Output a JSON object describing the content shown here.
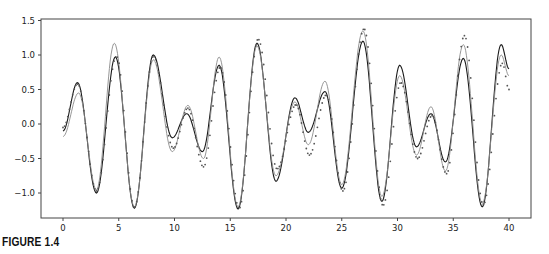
{
  "figure": {
    "caption": "FIGURE 1.4"
  },
  "chart_data": {
    "type": "line",
    "title": "",
    "xlabel": "",
    "ylabel": "",
    "xlim": [
      -2,
      42
    ],
    "ylim": [
      -1.37,
      1.5
    ],
    "xticks": [
      0,
      5,
      10,
      15,
      20,
      25,
      30,
      35,
      40
    ],
    "yticks": [
      1.5,
      1.0,
      0.5,
      0.0,
      -0.5,
      -1.0
    ],
    "ytick_labels": [
      "1.5",
      "1.0",
      "0.5",
      "0.0",
      "−0.5",
      "−1.0"
    ],
    "grid": false,
    "legend": null,
    "series": [
      {
        "name": "signal (black solid)",
        "color": "#1a1a1a",
        "style": "solid",
        "points": [
          [
            0,
            -0.1
          ],
          [
            1.3,
            0.6
          ],
          [
            3.0,
            -1.0
          ],
          [
            4.7,
            0.97
          ],
          [
            6.4,
            -1.22
          ],
          [
            8.1,
            1.0
          ],
          [
            9.8,
            -0.2
          ],
          [
            11.1,
            0.15
          ],
          [
            12.5,
            -0.4
          ],
          [
            14.0,
            0.85
          ],
          [
            15.7,
            -1.23
          ],
          [
            17.4,
            1.17
          ],
          [
            19.1,
            -0.83
          ],
          [
            20.8,
            0.38
          ],
          [
            22.0,
            -0.12
          ],
          [
            23.5,
            0.47
          ],
          [
            25.0,
            -0.93
          ],
          [
            26.9,
            1.2
          ],
          [
            28.6,
            -1.12
          ],
          [
            30.2,
            0.85
          ],
          [
            31.7,
            -0.33
          ],
          [
            33.0,
            0.15
          ],
          [
            34.3,
            -0.55
          ],
          [
            35.9,
            0.95
          ],
          [
            37.6,
            -1.2
          ],
          [
            39.3,
            1.15
          ],
          [
            40,
            0.8
          ]
        ]
      },
      {
        "name": "approximation (gray solid)",
        "color": "#8a8a8a",
        "style": "solid",
        "points": [
          [
            0,
            -0.18
          ],
          [
            1.4,
            0.45
          ],
          [
            3.0,
            -0.95
          ],
          [
            4.6,
            1.17
          ],
          [
            6.4,
            -1.2
          ],
          [
            8.1,
            0.93
          ],
          [
            9.8,
            -0.4
          ],
          [
            11.2,
            0.27
          ],
          [
            12.6,
            -0.5
          ],
          [
            14.0,
            0.97
          ],
          [
            15.7,
            -1.2
          ],
          [
            17.4,
            1.13
          ],
          [
            19.1,
            -0.75
          ],
          [
            20.8,
            0.32
          ],
          [
            22.0,
            -0.3
          ],
          [
            23.5,
            0.62
          ],
          [
            25.0,
            -0.88
          ],
          [
            26.9,
            1.35
          ],
          [
            28.6,
            -1.05
          ],
          [
            30.2,
            0.7
          ],
          [
            31.7,
            -0.45
          ],
          [
            33.0,
            0.25
          ],
          [
            34.3,
            -0.68
          ],
          [
            35.9,
            1.15
          ],
          [
            37.6,
            -1.15
          ],
          [
            39.3,
            1.0
          ],
          [
            40,
            0.7
          ]
        ]
      },
      {
        "name": "approximation (dotted)",
        "color": "#555555",
        "style": "dotted",
        "points": [
          [
            0,
            -0.05
          ],
          [
            1.3,
            0.58
          ],
          [
            3.0,
            -0.97
          ],
          [
            4.8,
            0.98
          ],
          [
            6.4,
            -1.21
          ],
          [
            8.1,
            0.98
          ],
          [
            9.9,
            -0.35
          ],
          [
            11.2,
            0.23
          ],
          [
            12.6,
            -0.62
          ],
          [
            14.1,
            0.82
          ],
          [
            15.8,
            -1.22
          ],
          [
            17.5,
            1.23
          ],
          [
            19.2,
            -0.65
          ],
          [
            20.9,
            0.28
          ],
          [
            22.1,
            -0.45
          ],
          [
            23.6,
            0.42
          ],
          [
            25.1,
            -0.97
          ],
          [
            27.0,
            1.38
          ],
          [
            28.7,
            -1.18
          ],
          [
            30.3,
            0.6
          ],
          [
            31.8,
            -0.5
          ],
          [
            33.1,
            0.12
          ],
          [
            34.4,
            -0.72
          ],
          [
            36.0,
            1.28
          ],
          [
            37.7,
            -1.17
          ],
          [
            39.4,
            0.88
          ],
          [
            40,
            0.5
          ]
        ]
      }
    ]
  }
}
